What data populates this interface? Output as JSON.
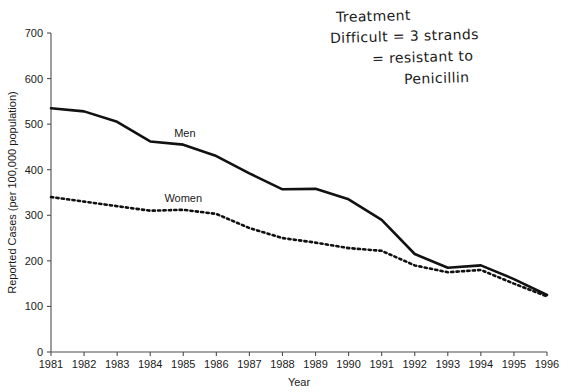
{
  "chart_data": {
    "type": "line",
    "title": "",
    "xlabel": "Year",
    "ylabel": "Reported Cases (per 100,000 population)",
    "xlim": [
      1981,
      1996
    ],
    "ylim": [
      0,
      700
    ],
    "ytick_step": 100,
    "grid": false,
    "legend_position": "inline-annotation",
    "categories": [
      "1981",
      "1982",
      "1983",
      "1984",
      "1985",
      "1986",
      "1987",
      "1988",
      "1989",
      "1990",
      "1991",
      "1992",
      "1993",
      "1994",
      "1995",
      "1996"
    ],
    "x": [
      1981,
      1982,
      1983,
      1984,
      1985,
      1986,
      1987,
      1988,
      1989,
      1990,
      1991,
      1992,
      1993,
      1994,
      1995,
      1996
    ],
    "yticks": [
      "0",
      "100",
      "200",
      "300",
      "400",
      "500",
      "600",
      "700"
    ],
    "series": [
      {
        "name": "Men",
        "style": "solid",
        "color": "#111111",
        "values": [
          535,
          528,
          505,
          462,
          455,
          430,
          392,
          357,
          358,
          335,
          290,
          215,
          185,
          190,
          160,
          125
        ]
      },
      {
        "name": "Women",
        "style": "dotted",
        "color": "#111111",
        "values": [
          340,
          330,
          320,
          310,
          312,
          303,
          272,
          250,
          240,
          228,
          222,
          190,
          175,
          180,
          150,
          122
        ]
      }
    ],
    "annotations": [
      {
        "text": "Men",
        "x": 1985.05,
        "y": 472
      },
      {
        "text": "Women",
        "x": 1985.0,
        "y": 330
      }
    ]
  },
  "handwriting": {
    "line1": "Treatment",
    "line2": "Difficult = 3 strands",
    "line3": "= resistant to",
    "line4": "Penicillin"
  }
}
